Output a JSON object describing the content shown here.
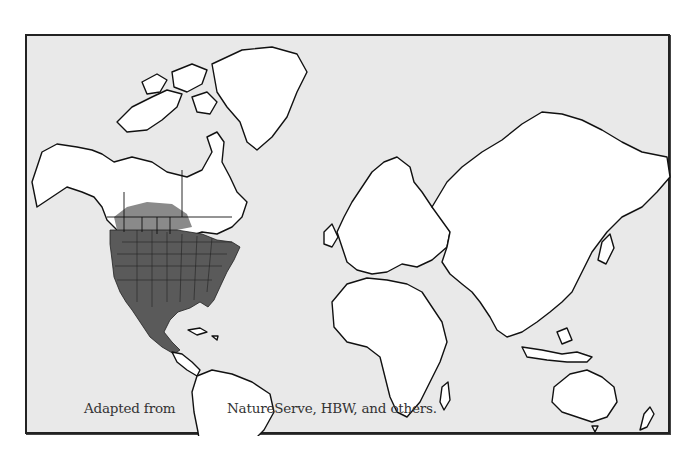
{
  "map": {
    "type": "world-range-map",
    "projection": "Mercator",
    "highlighted_region": "Breeding/year-round range: contiguous United States, southern Canadian prairies, and Mexico",
    "colors": {
      "ocean": "#e9e9e9",
      "land": "#ffffff",
      "range": "#5a5a5a",
      "range_peripheral": "#8a8a8a",
      "outline": "#111111",
      "frame": "#222222"
    }
  },
  "caption": {
    "left": "Adapted from",
    "right": "NatureServe, HBW, and others."
  }
}
